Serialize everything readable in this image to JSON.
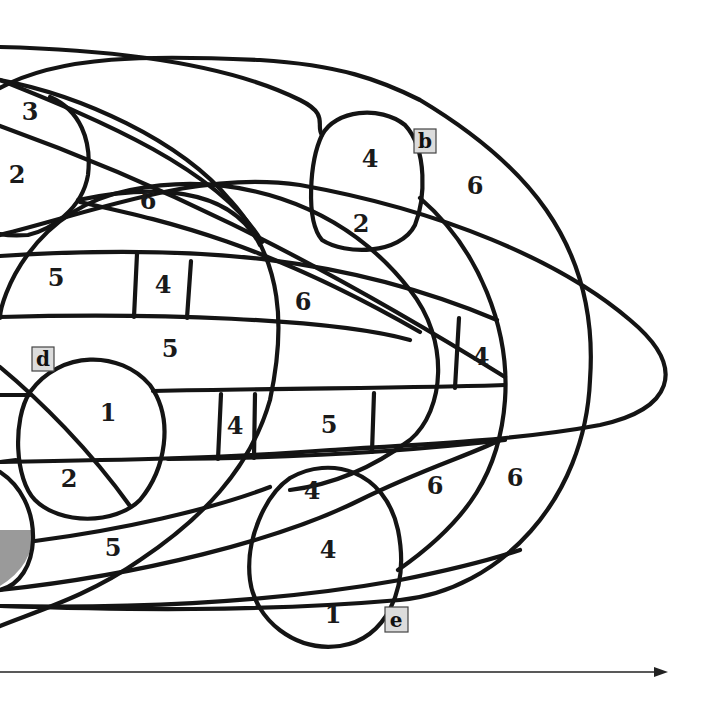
{
  "diagram": {
    "type": "region-map",
    "colors": {
      "line": "#141414",
      "shade": "#9a9a9a",
      "tag_fill": "#dcdcdc",
      "background": "#ffffff"
    },
    "tags": [
      {
        "id": "b",
        "label": "b",
        "x": 425,
        "y": 141
      },
      {
        "id": "d",
        "label": "d",
        "x": 43,
        "y": 359
      },
      {
        "id": "e",
        "label": "e",
        "x": 396,
        "y": 620
      }
    ],
    "regions": [
      {
        "label": "3",
        "x": 30,
        "y": 111
      },
      {
        "label": "2",
        "x": 17,
        "y": 174
      },
      {
        "label": "6",
        "x": 148,
        "y": 200
      },
      {
        "label": "4",
        "x": 370,
        "y": 158
      },
      {
        "label": "2",
        "x": 361,
        "y": 223
      },
      {
        "label": "6",
        "x": 475,
        "y": 185
      },
      {
        "label": "5",
        "x": 56,
        "y": 277
      },
      {
        "label": "4",
        "x": 163,
        "y": 284
      },
      {
        "label": "6",
        "x": 303,
        "y": 301
      },
      {
        "label": "5",
        "x": 170,
        "y": 348
      },
      {
        "label": "4",
        "x": 481,
        "y": 356
      },
      {
        "label": "1",
        "x": 108,
        "y": 412
      },
      {
        "label": "4",
        "x": 235,
        "y": 425
      },
      {
        "label": "5",
        "x": 329,
        "y": 424
      },
      {
        "label": "2",
        "x": 69,
        "y": 478
      },
      {
        "label": "4",
        "x": 312,
        "y": 490
      },
      {
        "label": "6",
        "x": 435,
        "y": 485
      },
      {
        "label": "6",
        "x": 515,
        "y": 477
      },
      {
        "label": "5",
        "x": 113,
        "y": 547
      },
      {
        "label": "4",
        "x": 328,
        "y": 549
      },
      {
        "label": "1",
        "x": 333,
        "y": 614
      }
    ],
    "axis": {
      "direction": "right",
      "y": 672,
      "x_start": 0,
      "x_end": 668
    }
  }
}
